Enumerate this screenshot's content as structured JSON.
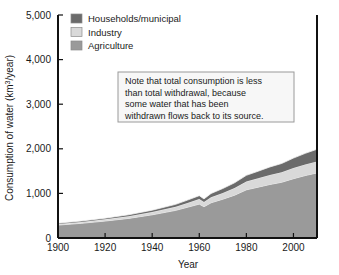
{
  "figure": {
    "background": "#ffffff",
    "frame_color": "#111111"
  },
  "chart_data": {
    "type": "area",
    "stacked": true,
    "title": "",
    "xlabel": "Year",
    "ylabel": "Consumption of water (km3/year)",
    "ylabel_display": "Consumption of water (km³/year)",
    "xlim": [
      1900,
      2010
    ],
    "ylim": [
      0,
      5000
    ],
    "xticks": [
      1900,
      1920,
      1940,
      1960,
      1980,
      2000
    ],
    "xtick_labels": [
      "1900",
      "1920",
      "1940",
      "1960",
      "1980",
      "2000"
    ],
    "yticks": [
      0,
      1000,
      2000,
      3000,
      4000,
      5000
    ],
    "ytick_labels": [
      "0",
      "1,000",
      "2,000",
      "3,000",
      "4,000",
      "5,000"
    ],
    "grid": false,
    "legend_position": "top-left",
    "x": [
      1900,
      1910,
      1920,
      1930,
      1940,
      1950,
      1955,
      1960,
      1962,
      1965,
      1970,
      1975,
      1980,
      1985,
      1990,
      1995,
      2000,
      2005,
      2010
    ],
    "series": [
      {
        "name": "Agriculture",
        "color": "#9a9a9a",
        "values": [
          290,
          330,
          380,
          440,
          520,
          620,
          690,
          760,
          700,
          790,
          870,
          960,
          1080,
          1140,
          1200,
          1250,
          1330,
          1400,
          1460
        ]
      },
      {
        "name": "Industry",
        "color": "#d9d9d9",
        "values": [
          25,
          30,
          38,
          48,
          62,
          80,
          95,
          112,
          105,
          122,
          140,
          160,
          185,
          200,
          215,
          225,
          240,
          250,
          258
        ]
      },
      {
        "name": "Households/municipal",
        "color": "#6b6b6b",
        "values": [
          18,
          22,
          27,
          33,
          42,
          55,
          65,
          78,
          72,
          86,
          100,
          118,
          140,
          158,
          178,
          196,
          222,
          248,
          272
        ]
      }
    ],
    "legend": [
      {
        "label": "Households/municipal",
        "color": "#6b6b6b"
      },
      {
        "label": "Industry",
        "color": "#d9d9d9"
      },
      {
        "label": "Agriculture",
        "color": "#9a9a9a"
      }
    ],
    "annotations": [
      {
        "name": "consumption-note",
        "lines": [
          "Note that total consumption is less",
          "than total withdrawal, because",
          "some water that has been",
          "withdrawn flows back to its source."
        ],
        "box": {
          "x": 118,
          "y": 72,
          "width": 176,
          "height": 50
        },
        "background": "#f7f7f7",
        "border": "#9a9a9a"
      }
    ]
  }
}
